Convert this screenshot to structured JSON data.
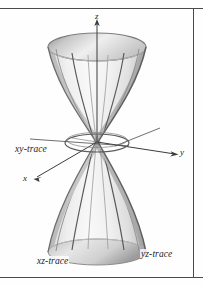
{
  "figure": {
    "surface_type": "hyperboloid-of-one-sheet",
    "background_color": "#fefefe",
    "frame": {
      "rule_color": "#4a4a4a",
      "has_top_rule": true,
      "has_bottom_rule": true,
      "has_right_rule": true
    },
    "axes": [
      {
        "id": "z",
        "label": "z",
        "direction": "up",
        "arrow": true
      },
      {
        "id": "y",
        "label": "y",
        "direction": "right",
        "arrow": true
      },
      {
        "id": "x",
        "label": "x",
        "direction": "down-left",
        "arrow": true
      }
    ],
    "traces": [
      {
        "id": "xy",
        "label": "xy-trace",
        "shape": "ellipse",
        "has_leader_line": true
      },
      {
        "id": "xz",
        "label": "xz-trace",
        "shape": "hyperbola",
        "has_leader_line": false
      },
      {
        "id": "yz",
        "label": "yz-trace",
        "shape": "hyperbola",
        "has_leader_line": false
      }
    ],
    "colors": {
      "surface_light": "#f4f4f4",
      "surface_mid": "#d8d8d8",
      "surface_dark": "#a8a8a8",
      "silhouette": "#6e6e6e",
      "trace_curve": "#6b6b6b",
      "axis_line": "#3c3c3c",
      "text": "#1d1d1d"
    }
  }
}
